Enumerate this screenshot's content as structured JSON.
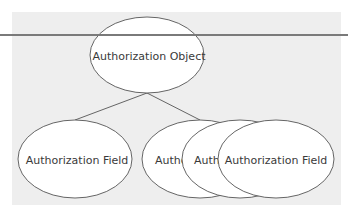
{
  "diagram": {
    "root": {
      "label": "Authorization Object",
      "cx": 147,
      "cy": 55,
      "rx": 57,
      "ry": 38
    },
    "children": [
      {
        "label": "Authorization Field",
        "cx": 75,
        "cy": 159,
        "rx": 57,
        "ry": 39
      },
      {
        "label": "Autho",
        "cx": 200,
        "cy": 159,
        "rx": 58,
        "ry": 39
      },
      {
        "label": "Auth",
        "cx": 240,
        "cy": 159,
        "rx": 58,
        "ry": 39
      },
      {
        "label": "Authorization Field",
        "cx": 276,
        "cy": 159,
        "rx": 58,
        "ry": 39
      }
    ],
    "edges": [
      {
        "from": "root",
        "to": 0
      },
      {
        "from": "root",
        "to": 1
      }
    ]
  },
  "colors": {
    "panel": "#eeeeee",
    "stroke": "#555555",
    "node_fill": "#ffffff",
    "rule": "#7a7a7a",
    "text": "#3a3a3a"
  }
}
